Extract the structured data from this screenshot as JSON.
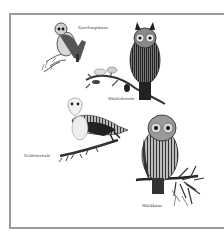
{
  "plate": {
    "border_color": "#9a9a9a",
    "background": "#ffffff",
    "ink_color": "#1e1e1e"
  },
  "owls": [
    {
      "id": "sperlingskauz",
      "caption": "Sperlingskauz",
      "icon": "small-owl-illustration"
    },
    {
      "id": "waldohreule",
      "caption": "Waldohreule",
      "icon": "eared-owl-illustration"
    },
    {
      "id": "schleiereule",
      "caption": "Schleiereule",
      "icon": "barn-owl-illustration"
    },
    {
      "id": "waldkauz",
      "caption": "Waldkauz",
      "icon": "tawny-owl-illustration"
    }
  ]
}
